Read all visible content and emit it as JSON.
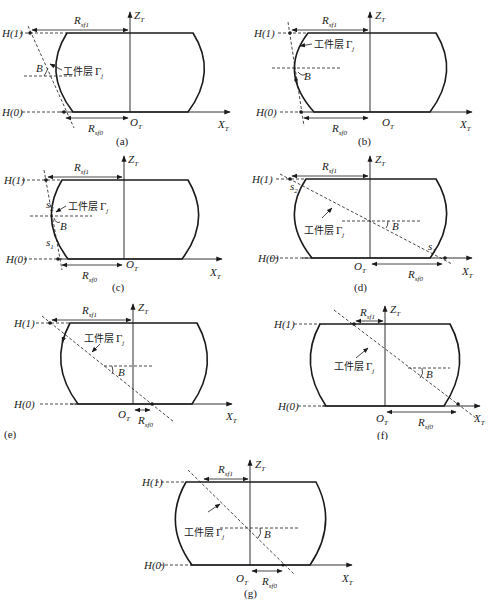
{
  "figure": {
    "labels": {
      "h1": "H(1)",
      "h0": "H(0)",
      "z_axis": "Z",
      "z_sub": "T",
      "x_axis": "X",
      "x_sub": "T",
      "origin": "O",
      "origin_sub": "T",
      "r_top": "R",
      "r_top_sub": "sf1",
      "r_bottom": "R",
      "r_bottom_sub": "sf0",
      "angle": "B",
      "layer_cn": "工件层",
      "layer_gamma": "Γ",
      "layer_sub": "j",
      "s1": "s",
      "s1_sub": "1",
      "s2": "s",
      "s2_sub": "2"
    },
    "panels": [
      {
        "id": "a",
        "caption": "(a)"
      },
      {
        "id": "b",
        "caption": "(b)"
      },
      {
        "id": "c",
        "caption": "(c)"
      },
      {
        "id": "d",
        "caption": "(d)"
      },
      {
        "id": "e",
        "caption": "(e)"
      },
      {
        "id": "f",
        "caption": "(f)"
      },
      {
        "id": "g",
        "caption": "(g)"
      }
    ]
  }
}
